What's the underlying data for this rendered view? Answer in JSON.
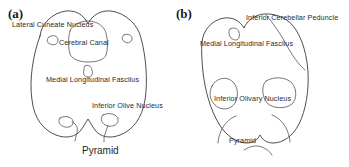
{
  "figure": {
    "type": "anatomical-line-drawing",
    "background_color": "#ffffff",
    "stroke_color": "#3a3a3a",
    "text_color": "#2a2a2a"
  },
  "panels": [
    {
      "tag": "(a)",
      "tag_name": "panel-a",
      "labels": [
        {
          "text": "Lateral Cuneate Nucleus",
          "name": "label-lateral-cuneate-nucleus"
        },
        {
          "text": "Cerebral Canal",
          "name": "label-cerebral-canal"
        },
        {
          "text": "Medial Longitudinal Fascilus",
          "name": "label-medial-longitudinal-fasciculus"
        },
        {
          "text": "Inferior Olive Nucleus",
          "name": "label-inferior-olive-nucleus"
        }
      ],
      "caption": "Pyramid"
    },
    {
      "tag": "(b)",
      "tag_name": "panel-b",
      "labels": [
        {
          "text": "Inferior Cerebellar Peduncle",
          "name": "label-inferior-cerebellar-peduncle"
        },
        {
          "text": "Medial Longitudinal Fascilus",
          "name": "label-medial-longitudinal-fasciculus"
        },
        {
          "text": "Inferior Olivary Nucleus",
          "name": "label-inferior-olivary-nucleus"
        },
        {
          "text": "Pyramid",
          "name": "label-pyramid"
        }
      ],
      "caption": ""
    }
  ]
}
